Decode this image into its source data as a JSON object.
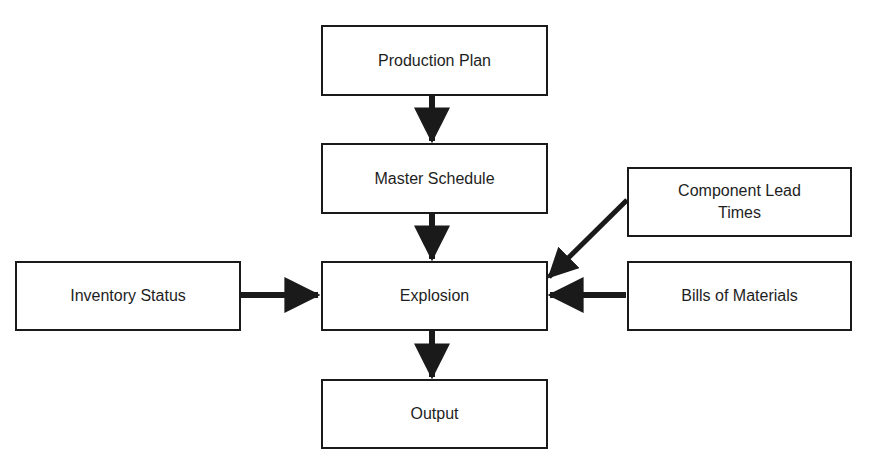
{
  "diagram": {
    "type": "flowchart",
    "nodes": {
      "production_plan": {
        "label": "Production Plan"
      },
      "master_schedule": {
        "label": "Master Schedule"
      },
      "explosion": {
        "label": "Explosion"
      },
      "output": {
        "label": "Output"
      },
      "inventory_status": {
        "label": "Inventory Status"
      },
      "component_lead_times": {
        "label": "Component Lead Times"
      },
      "bills_of_materials": {
        "label": "Bills of Materials"
      }
    },
    "edges": [
      {
        "from": "Production Plan",
        "to": "Master Schedule"
      },
      {
        "from": "Master Schedule",
        "to": "Explosion"
      },
      {
        "from": "Inventory Status",
        "to": "Explosion"
      },
      {
        "from": "Component Lead Times",
        "to": "Explosion"
      },
      {
        "from": "Bills of Materials",
        "to": "Explosion"
      },
      {
        "from": "Explosion",
        "to": "Output"
      }
    ],
    "colors": {
      "stroke": "#1a1a1a",
      "background": "#ffffff",
      "text": "#1e1e1e"
    }
  }
}
